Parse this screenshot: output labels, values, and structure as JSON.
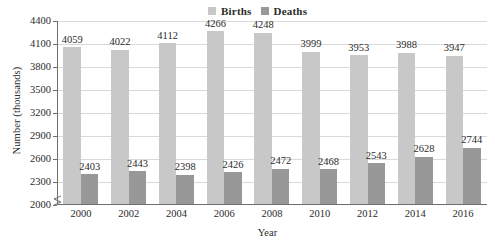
{
  "chart_data": {
    "type": "bar",
    "title": "",
    "xlabel": "Year",
    "ylabel": "Number (thousands)",
    "categories": [
      "2000",
      "2002",
      "2004",
      "2006",
      "2008",
      "2010",
      "2012",
      "2014",
      "2016"
    ],
    "series": [
      {
        "name": "Births",
        "color": "#c8c8c8",
        "values": [
          4059,
          4022,
          4112,
          4266,
          4248,
          3999,
          3953,
          3988,
          3947
        ]
      },
      {
        "name": "Deaths",
        "color": "#989898",
        "values": [
          2403,
          2443,
          2398,
          2426,
          2472,
          2468,
          2543,
          2628,
          2744
        ]
      }
    ],
    "ylim": [
      2000,
      4400
    ],
    "yticks": [
      2000,
      2300,
      2600,
      2900,
      3200,
      3500,
      3800,
      4100,
      4400
    ],
    "ytick_labels": [
      "2000",
      "2300",
      "2600",
      "2900",
      "3200",
      "3500",
      "3800",
      "4100",
      "4400"
    ],
    "grid": true,
    "axis_break": true,
    "legend_position": "top-right",
    "data_labels": true
  }
}
